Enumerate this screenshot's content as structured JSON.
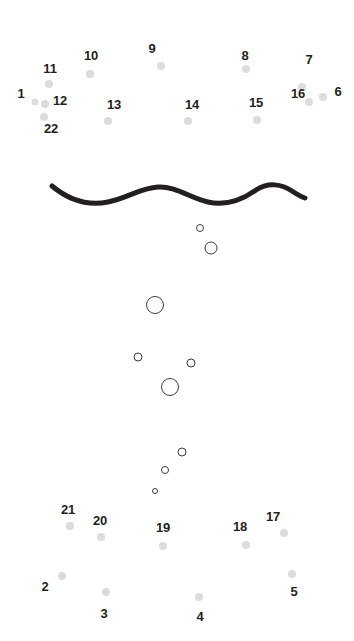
{
  "page": {
    "background_color": "#ffffff",
    "width": 354,
    "height": 641
  },
  "style": {
    "dot_color": "#dcdcdc",
    "label_color": "#231f20",
    "bubble_stroke_color": "#3b3b44",
    "wave_color": "#231f20"
  },
  "dots": [
    {
      "label": "1",
      "lx": 21,
      "ly": 93,
      "cx": 35,
      "cy": 102,
      "r": 3.5
    },
    {
      "label": "11",
      "lx": 50,
      "ly": 68,
      "cx": 49,
      "cy": 84,
      "r": 4.0
    },
    {
      "label": "12",
      "lx": 60,
      "ly": 100,
      "cx": 45,
      "cy": 104,
      "r": 4.0
    },
    {
      "label": "22",
      "lx": 51,
      "ly": 128,
      "cx": 44,
      "cy": 117,
      "r": 4.0
    },
    {
      "label": "10",
      "lx": 91,
      "ly": 55,
      "cx": 90,
      "cy": 74,
      "r": 4.0
    },
    {
      "label": "13",
      "lx": 114,
      "ly": 104,
      "cx": 108,
      "cy": 121,
      "r": 4.0
    },
    {
      "label": "9",
      "lx": 152,
      "ly": 48,
      "cx": 161,
      "cy": 66,
      "r": 4.0
    },
    {
      "label": "14",
      "lx": 192,
      "ly": 104,
      "cx": 188,
      "cy": 121,
      "r": 4.0
    },
    {
      "label": "8",
      "lx": 245,
      "ly": 55,
      "cx": 246,
      "cy": 69,
      "r": 4.0
    },
    {
      "label": "15",
      "lx": 256,
      "ly": 102,
      "cx": 257,
      "cy": 120,
      "r": 4.0
    },
    {
      "label": "7",
      "lx": 309,
      "ly": 59,
      "cx": 302,
      "cy": 87,
      "r": 4.0
    },
    {
      "label": "16",
      "lx": 298,
      "ly": 93,
      "cx": 309,
      "cy": 102,
      "r": 4.0
    },
    {
      "label": "6",
      "lx": 338,
      "ly": 91,
      "cx": 323,
      "cy": 97,
      "r": 4.0
    },
    {
      "label": "21",
      "lx": 68,
      "ly": 509,
      "cx": 70,
      "cy": 526,
      "r": 4.0
    },
    {
      "label": "20",
      "lx": 100,
      "ly": 520,
      "cx": 101,
      "cy": 537,
      "r": 4.0
    },
    {
      "label": "19",
      "lx": 163,
      "ly": 527,
      "cx": 163,
      "cy": 546,
      "r": 4.0
    },
    {
      "label": "18",
      "lx": 240,
      "ly": 526,
      "cx": 246,
      "cy": 545,
      "r": 4.0
    },
    {
      "label": "17",
      "lx": 273,
      "ly": 516,
      "cx": 284,
      "cy": 533,
      "r": 4.0
    },
    {
      "label": "2",
      "lx": 45,
      "ly": 586,
      "cx": 62,
      "cy": 576,
      "r": 4.0
    },
    {
      "label": "3",
      "lx": 104,
      "ly": 613,
      "cx": 106,
      "cy": 592,
      "r": 4.0
    },
    {
      "label": "4",
      "lx": 200,
      "ly": 616,
      "cx": 199,
      "cy": 597,
      "r": 4.0
    },
    {
      "label": "5",
      "lx": 294,
      "ly": 591,
      "cx": 292,
      "cy": 574,
      "r": 4.0
    }
  ],
  "bubbles": [
    {
      "cx": 200,
      "cy": 228,
      "d": 8
    },
    {
      "cx": 211,
      "cy": 248,
      "d": 13
    },
    {
      "cx": 155,
      "cy": 305,
      "d": 18
    },
    {
      "cx": 138,
      "cy": 357,
      "d": 9
    },
    {
      "cx": 191,
      "cy": 363,
      "d": 9
    },
    {
      "cx": 170,
      "cy": 387,
      "d": 18
    },
    {
      "cx": 182,
      "cy": 452,
      "d": 9
    },
    {
      "cx": 165,
      "cy": 470,
      "d": 8
    },
    {
      "cx": 155,
      "cy": 491,
      "d": 6
    }
  ],
  "wave": {
    "name": "wavy-line",
    "stroke_width": 5,
    "path": "M 52 186 C 70 201, 88 206, 108 202 C 128 198, 140 188, 158 187 C 176 186, 190 198, 208 202 C 226 206, 242 200, 256 190 C 268 182, 282 184, 292 191 C 298 195, 302 197, 305 198"
  }
}
